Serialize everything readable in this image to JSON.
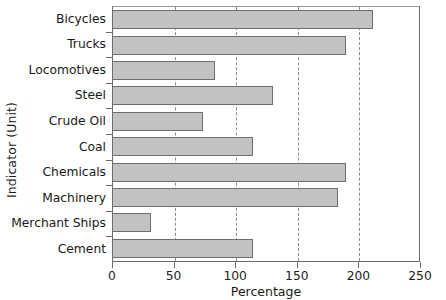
{
  "chart_data": {
    "type": "bar",
    "orientation": "horizontal",
    "title": "",
    "xlabel": "Percentage",
    "ylabel": "Indicator (Unit)",
    "categories": [
      "Bicycles",
      "Trucks",
      "Locomotives",
      "Steel",
      "Crude Oil",
      "Coal",
      "Chemicals",
      "Machinery",
      "Merchant Ships",
      "Cement"
    ],
    "values": [
      211,
      189,
      83,
      130,
      73,
      114,
      189,
      183,
      31,
      114
    ],
    "xlim": [
      0,
      250
    ],
    "xticks": [
      0,
      50,
      100,
      150,
      200,
      250
    ],
    "xtick_labels": [
      "0",
      "50",
      "100",
      "150",
      "200",
      "250"
    ],
    "grid": "vertical-dashed",
    "legend": "none",
    "bar_fill": "#c2c2c2",
    "bar_border": "#6e6e6e",
    "axis_color": "#6b6b6b",
    "grid_color": "#8c8c8c"
  }
}
